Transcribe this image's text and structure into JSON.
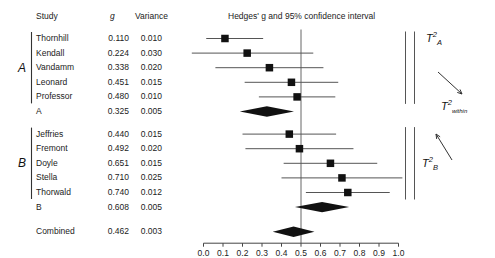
{
  "table": {
    "headers": {
      "study": "Study",
      "g": "g",
      "variance": "Variance"
    },
    "rows": [
      {
        "study": "Thornhill",
        "g": "0.110",
        "variance": "0.010",
        "group": "A",
        "kind": "study",
        "g_val": 0.11,
        "ci_lo": 0.014,
        "ci_hi": 0.306
      },
      {
        "study": "Kendall",
        "g": "0.224",
        "variance": "0.030",
        "group": "A",
        "kind": "study",
        "g_val": 0.224,
        "ci_lo": -0.115,
        "ci_hi": 0.563
      },
      {
        "study": "Vandamm",
        "g": "0.338",
        "variance": "0.020",
        "group": "A",
        "kind": "study",
        "g_val": 0.338,
        "ci_lo": 0.061,
        "ci_hi": 0.615
      },
      {
        "study": "Leonard",
        "g": "0.451",
        "variance": "0.015",
        "group": "A",
        "kind": "study",
        "g_val": 0.451,
        "ci_lo": 0.211,
        "ci_hi": 0.691
      },
      {
        "study": "Professor",
        "g": "0.480",
        "variance": "0.010",
        "group": "A",
        "kind": "study",
        "g_val": 0.48,
        "ci_lo": 0.284,
        "ci_hi": 0.676
      },
      {
        "study": "A",
        "g": "0.325",
        "variance": "0.005",
        "group": "A",
        "kind": "summary",
        "g_val": 0.325,
        "ci_lo": 0.186,
        "ci_hi": 0.464
      },
      {
        "study": "Jeffries",
        "g": "0.440",
        "variance": "0.015",
        "group": "B",
        "kind": "study",
        "g_val": 0.44,
        "ci_lo": 0.2,
        "ci_hi": 0.68
      },
      {
        "study": "Fremont",
        "g": "0.492",
        "variance": "0.020",
        "group": "B",
        "kind": "study",
        "g_val": 0.492,
        "ci_lo": 0.215,
        "ci_hi": 0.769
      },
      {
        "study": "Doyle",
        "g": "0.651",
        "variance": "0.015",
        "group": "B",
        "kind": "study",
        "g_val": 0.651,
        "ci_lo": 0.411,
        "ci_hi": 0.891
      },
      {
        "study": "Stella",
        "g": "0.710",
        "variance": "0.025",
        "group": "B",
        "kind": "study",
        "g_val": 0.71,
        "ci_lo": 0.4,
        "ci_hi": 1.02
      },
      {
        "study": "Thorwald",
        "g": "0.740",
        "variance": "0.012",
        "group": "B",
        "kind": "study",
        "g_val": 0.74,
        "ci_lo": 0.525,
        "ci_hi": 0.955
      },
      {
        "study": "B",
        "g": "0.608",
        "variance": "0.005",
        "group": "B",
        "kind": "summary",
        "g_val": 0.608,
        "ci_lo": 0.469,
        "ci_hi": 0.747
      },
      {
        "study": "Combined",
        "g": "0.462",
        "variance": "0.003",
        "group": "",
        "kind": "summary",
        "g_val": 0.462,
        "ci_lo": 0.355,
        "ci_hi": 0.569
      }
    ]
  },
  "groups": [
    {
      "label": "A",
      "first_row": 0,
      "last_row": 4
    },
    {
      "label": "B",
      "first_row": 6,
      "last_row": 10
    }
  ],
  "annotations": [
    {
      "name": "tau2-a",
      "base": "T",
      "sup": "2",
      "sub": "A",
      "sub_small": false
    },
    {
      "name": "tau2-within",
      "base": "T",
      "sup": "2",
      "sub": "within",
      "sub_small": true
    },
    {
      "name": "tau2-b",
      "base": "T",
      "sup": "2",
      "sub": "B",
      "sub_small": false
    }
  ],
  "chart_data": {
    "type": "forest",
    "title": "Hedges' g and 95% confidence interval",
    "xlabel": "",
    "ylabel": "",
    "xlim": [
      0.0,
      1.0
    ],
    "xticks": [
      "0.0",
      "0.1",
      "0.2",
      "0.3",
      "0.4",
      "0.5",
      "0.6",
      "0.7",
      "0.8",
      "0.9",
      "1.0"
    ],
    "xtick_values": [
      0.0,
      0.1,
      0.2,
      0.3,
      0.4,
      0.5,
      0.6,
      0.7,
      0.8,
      0.9,
      1.0
    ],
    "reference_line": 0.5,
    "grid": false,
    "legend": "none",
    "effect_label": "g",
    "categories": [
      "Thornhill",
      "Kendall",
      "Vandamm",
      "Leonard",
      "Professor",
      "A",
      "Jeffries",
      "Fremont",
      "Doyle",
      "Stella",
      "Thorwald",
      "B",
      "Combined"
    ],
    "values": [
      0.11,
      0.224,
      0.338,
      0.451,
      0.48,
      0.325,
      0.44,
      0.492,
      0.651,
      0.71,
      0.74,
      0.608,
      0.462
    ],
    "variances": [
      0.01,
      0.03,
      0.02,
      0.015,
      0.01,
      0.005,
      0.015,
      0.02,
      0.025,
      0.012,
      0.005,
      0.005,
      0.003
    ],
    "ci_low": [
      0.014,
      -0.115,
      0.061,
      0.211,
      0.284,
      0.186,
      0.2,
      0.215,
      0.411,
      0.4,
      0.525,
      0.469,
      0.355
    ],
    "ci_high": [
      0.306,
      0.563,
      0.615,
      0.691,
      0.676,
      0.464,
      0.68,
      0.769,
      0.891,
      1.02,
      0.955,
      0.747,
      0.569
    ],
    "markers": [
      "square",
      "square",
      "square",
      "square",
      "square",
      "diamond",
      "square",
      "square",
      "square",
      "square",
      "square",
      "diamond",
      "diamond"
    ],
    "colors": {
      "marker": "#111111",
      "line": "#555555",
      "axis": "#444444",
      "reference": "#666666"
    }
  }
}
